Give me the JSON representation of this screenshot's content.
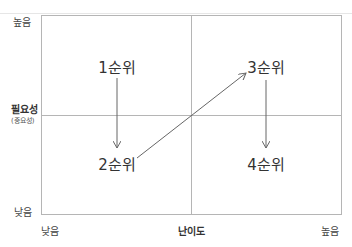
{
  "diagram": {
    "type": "priority-matrix",
    "y_axis": {
      "title": "필요성",
      "subtitle": "(중요성)",
      "high_label": "높음",
      "low_label": "낮음"
    },
    "x_axis": {
      "title": "난이도",
      "low_label": "낮음",
      "high_label": "높음"
    },
    "quadrants": [
      {
        "label": "1순위",
        "position": "top-left"
      },
      {
        "label": "2순위",
        "position": "bottom-left"
      },
      {
        "label": "3순위",
        "position": "top-right"
      },
      {
        "label": "4순위",
        "position": "bottom-right"
      }
    ],
    "flow": [
      "1순위",
      "2순위",
      "3순위",
      "4순위"
    ],
    "colors": {
      "frame": "#b5b5b5",
      "arrow": "#666666",
      "text": "#333333"
    }
  }
}
